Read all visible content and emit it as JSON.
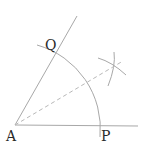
{
  "diagram": {
    "labels": {
      "vertex": "A",
      "point_on_horizontal": "P",
      "point_on_slanted": "Q"
    },
    "colors": {
      "line": "#a8a8a8",
      "dashed": "#b8b8b8",
      "text": "#2a2a2a",
      "background": "#ffffff"
    }
  }
}
